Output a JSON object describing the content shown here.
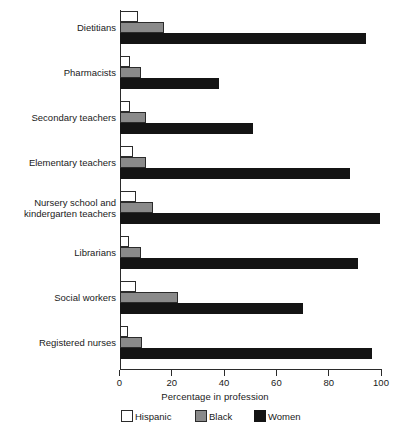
{
  "chart_data": {
    "type": "bar",
    "orientation": "horizontal",
    "title": "",
    "xlabel": "Percentage in profession",
    "ylabel": "",
    "xlim": [
      0,
      100
    ],
    "xticks": [
      0,
      20,
      40,
      60,
      80,
      100
    ],
    "xtick_labels": [
      "0",
      "20",
      "40",
      "60",
      "80",
      "100"
    ],
    "grid": false,
    "legend_position": "bottom",
    "categories": [
      "Dietitians",
      "Pharmacists",
      "Secondary teachers",
      "Elementary teachers",
      "Nursery school and\nkindergarten teachers",
      "Librarians",
      "Social workers",
      "Registered nurses"
    ],
    "series": [
      {
        "name": "Hispanic",
        "color": "#ffffff",
        "edge_color": "#2b2b2b",
        "values": [
          7,
          4,
          4,
          5,
          6,
          3.5,
          6,
          3
        ]
      },
      {
        "name": "Black",
        "color": "#8a8a8a",
        "edge_color": "#2b2b2b",
        "values": [
          17,
          8,
          10,
          10,
          12.5,
          8,
          22,
          8.5
        ]
      },
      {
        "name": "Women",
        "color": "#141414",
        "edge_color": "#141414",
        "values": [
          94,
          38,
          51,
          88,
          99.5,
          91,
          70,
          96.5
        ]
      }
    ]
  },
  "legend": {
    "items": [
      {
        "label": "Hispanic"
      },
      {
        "label": "Black"
      },
      {
        "label": "Women"
      }
    ]
  }
}
